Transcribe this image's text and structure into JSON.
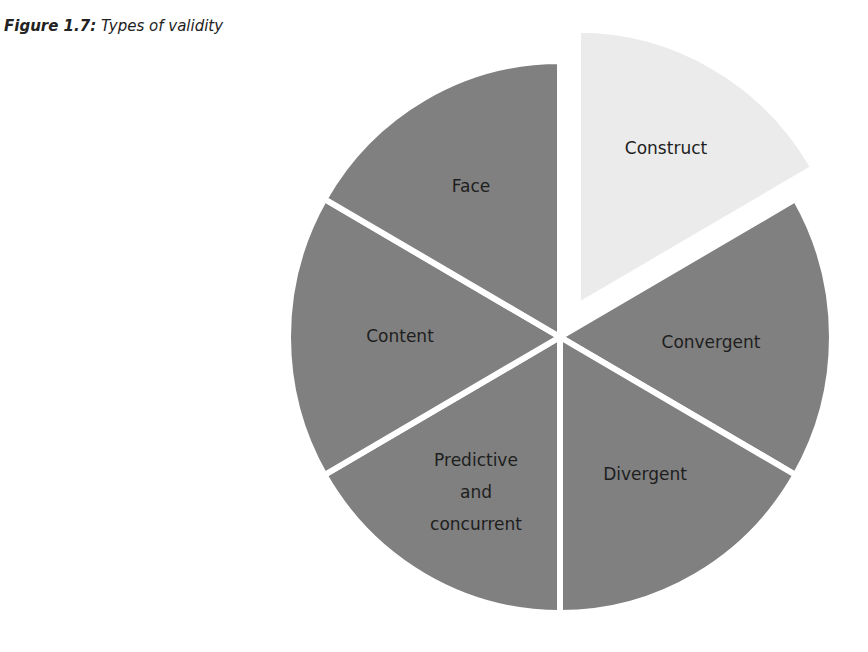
{
  "figure": {
    "number": "Figure 1.7:",
    "caption": "Types of validity"
  },
  "colors": {
    "slice_default": "#808080",
    "slice_highlight": "#ebebeb",
    "separator": "#ffffff",
    "label": "#1e1e1e"
  },
  "chart_data": {
    "type": "pie",
    "title": "Figure 1.7: Types of validity",
    "categories": [
      "Construct",
      "Convergent",
      "Divergent",
      "Predictive and concurrent",
      "Content",
      "Face"
    ],
    "values": [
      1,
      1,
      1,
      1,
      1,
      1
    ],
    "exploded": [
      "Construct"
    ],
    "highlighted": "Construct",
    "start_angle_deg_clockwise_from_top": 0,
    "legend": "none (labels inside slices)"
  },
  "labels": {
    "construct": "Construct",
    "convergent": "Convergent",
    "divergent": "Divergent",
    "predictive_line1": "Predictive",
    "predictive_line2": "and",
    "predictive_line3": "concurrent",
    "content": "Content",
    "face": "Face"
  }
}
